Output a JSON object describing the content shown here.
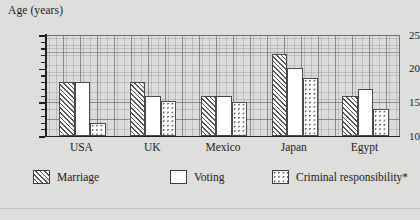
{
  "chart_data": {
    "type": "bar",
    "title": "Age (years)",
    "xlabel": "",
    "ylabel": "Age (years)",
    "ylim": [
      10,
      25
    ],
    "yticks": [
      10,
      15,
      20,
      25
    ],
    "ytick_labels": [
      "10",
      "15",
      "20",
      "25"
    ],
    "minor_tick_step": 1,
    "grid": true,
    "legend_position": "bottom",
    "categories": [
      "USA",
      "UK",
      "Mexico",
      "Japan",
      "Egypt"
    ],
    "series": [
      {
        "name": "Marriage",
        "pattern": "diagonal-hatch",
        "values": [
          18,
          18,
          16,
          22.2,
          16
        ]
      },
      {
        "name": "Voting",
        "pattern": "solid-white",
        "values": [
          18,
          16,
          16,
          20.1,
          17
        ]
      },
      {
        "name": "Criminal responsibility*",
        "pattern": "dotted",
        "values": [
          12,
          15.2,
          15,
          18.6,
          14
        ]
      }
    ]
  },
  "axis": {
    "y_title": "Age (years)"
  },
  "legend": {
    "items": [
      {
        "label": "Marriage"
      },
      {
        "label": "Voting"
      },
      {
        "label": "Criminal responsibility*"
      }
    ]
  },
  "colors": {
    "background": "#dededc",
    "plot_background": "#dcdcda",
    "axis": "#212121",
    "grid_fine": "#787880",
    "grid_coarse": "#5f5f64",
    "bar_outline": "#4a4a4d",
    "bar_fill": "#ffffff"
  }
}
